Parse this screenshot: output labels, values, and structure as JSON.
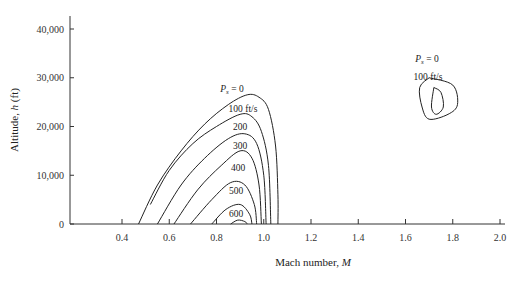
{
  "chart_data": {
    "type": "line",
    "title": "",
    "xlabel": "Mach number, M",
    "ylabel": "Altitude, h (ft)",
    "xlim": [
      0.2,
      2.05
    ],
    "ylim": [
      0,
      42000
    ],
    "x_ticks": [
      "0.4",
      "0.6",
      "0.8",
      "1.0",
      "1.2",
      "1.4",
      "1.6",
      "1.8",
      "2.0"
    ],
    "y_ticks": [
      "0",
      "10,000",
      "20,000",
      "30,000",
      "40,000"
    ],
    "grid": false,
    "series": [
      {
        "name": "Ps = 0",
        "label": "P_s = 0",
        "points": [
          [
            0.47,
            0
          ],
          [
            0.55,
            8000
          ],
          [
            0.65,
            15000
          ],
          [
            0.75,
            20500
          ],
          [
            0.85,
            24500
          ],
          [
            0.93,
            26500
          ],
          [
            0.98,
            26000
          ],
          [
            1.02,
            23500
          ],
          [
            1.05,
            16000
          ],
          [
            1.06,
            6000
          ],
          [
            1.06,
            0
          ]
        ]
      },
      {
        "name": "100 ft/s",
        "label": "100 ft/s",
        "points": [
          [
            0.52,
            4000
          ],
          [
            0.6,
            11000
          ],
          [
            0.7,
            16500
          ],
          [
            0.8,
            20000
          ],
          [
            0.9,
            22500
          ],
          [
            0.95,
            22000
          ],
          [
            0.99,
            19000
          ],
          [
            1.02,
            12000
          ],
          [
            1.03,
            0
          ]
        ]
      },
      {
        "name": "200",
        "label": "200",
        "points": [
          [
            0.55,
            0
          ],
          [
            0.65,
            8000
          ],
          [
            0.75,
            13500
          ],
          [
            0.85,
            17500
          ],
          [
            0.92,
            18500
          ],
          [
            0.97,
            16500
          ],
          [
            1.0,
            10000
          ],
          [
            1.01,
            0
          ]
        ]
      },
      {
        "name": "300",
        "label": "300",
        "points": [
          [
            0.62,
            0
          ],
          [
            0.72,
            7000
          ],
          [
            0.82,
            12000
          ],
          [
            0.9,
            15000
          ],
          [
            0.95,
            13500
          ],
          [
            0.98,
            8000
          ],
          [
            0.99,
            0
          ]
        ]
      },
      {
        "name": "400",
        "label": "400",
        "points": [
          [
            0.69,
            0
          ],
          [
            0.78,
            5000
          ],
          [
            0.86,
            8500
          ],
          [
            0.92,
            8000
          ],
          [
            0.96,
            4000
          ],
          [
            0.97,
            0
          ]
        ]
      },
      {
        "name": "500",
        "label": "500",
        "points": [
          [
            0.78,
            0
          ],
          [
            0.84,
            3000
          ],
          [
            0.9,
            4000
          ],
          [
            0.94,
            2000
          ],
          [
            0.95,
            0
          ]
        ]
      },
      {
        "name": "600",
        "label": "600",
        "points": [
          [
            0.86,
            0
          ],
          [
            0.89,
            800
          ],
          [
            0.92,
            500
          ],
          [
            0.93,
            0
          ]
        ]
      },
      {
        "name": "Ps = 0 (supersonic island)",
        "label": "P_s = 0",
        "closed": true,
        "points": [
          [
            1.7,
            30000
          ],
          [
            1.8,
            28500
          ],
          [
            1.82,
            24500
          ],
          [
            1.78,
            22500
          ],
          [
            1.7,
            21500
          ],
          [
            1.67,
            24000
          ],
          [
            1.66,
            28000
          ],
          [
            1.7,
            30000
          ]
        ]
      },
      {
        "name": "100 ft/s (supersonic island)",
        "label": "100 ft/s",
        "closed": true,
        "points": [
          [
            1.72,
            28000
          ],
          [
            1.75,
            27000
          ],
          [
            1.76,
            24000
          ],
          [
            1.73,
            22500
          ],
          [
            1.71,
            24000
          ],
          [
            1.72,
            28000
          ]
        ]
      }
    ],
    "annotations": [
      "P_s = 0",
      "100 ft/s",
      "200",
      "300",
      "400",
      "500",
      "600",
      "P_s = 0",
      "100 ft/s"
    ]
  }
}
